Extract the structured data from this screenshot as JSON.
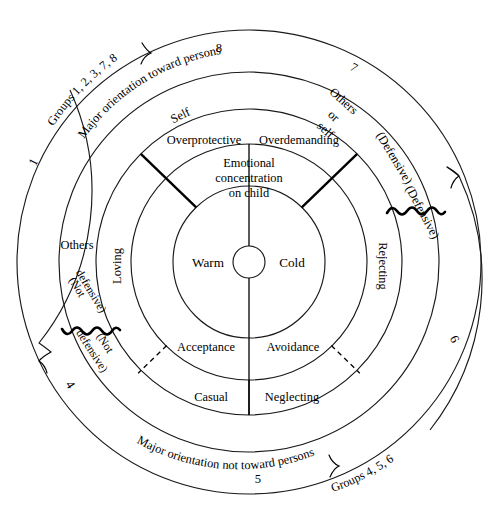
{
  "diagram": {
    "type": "concentric-circumplex",
    "center": {
      "x": 249,
      "y": 262
    },
    "core": {
      "label": "",
      "radius": 16
    },
    "rings": [
      {
        "name": "affect",
        "inner_radius": 16,
        "outer_radius": 76,
        "segments": [
          {
            "id": "warm",
            "label": "Warm",
            "side": "left"
          },
          {
            "id": "cold",
            "label": "Cold",
            "side": "right"
          }
        ]
      },
      {
        "name": "attitude",
        "inner_radius": 76,
        "outer_radius": 118,
        "segments": [
          {
            "id": "emotional-concentration",
            "label": "Emotional\nconcentration\non child",
            "position": "top"
          },
          {
            "id": "acceptance",
            "label": "Acceptance",
            "position": "bottom-left"
          },
          {
            "id": "avoidance",
            "label": "Avoidance",
            "position": "bottom-right"
          }
        ]
      },
      {
        "name": "behavior",
        "inner_radius": 118,
        "outer_radius": 153,
        "segments": [
          {
            "id": "overprotective",
            "label": "Overprotective",
            "position": "top-left"
          },
          {
            "id": "overdemanding",
            "label": "Overdemanding",
            "position": "top-right"
          },
          {
            "id": "loving",
            "label": "Loving",
            "position": "left"
          },
          {
            "id": "rejecting",
            "label": "Rejecting",
            "position": "right"
          },
          {
            "id": "casual",
            "label": "Casual",
            "position": "bottom-left"
          },
          {
            "id": "neglecting",
            "label": "Neglecting",
            "position": "bottom-right"
          }
        ]
      },
      {
        "name": "orientation",
        "inner_radius": 153,
        "outer_radius": 190,
        "segments": [
          {
            "id": "self",
            "label": "Self",
            "position": "top-center-left"
          },
          {
            "id": "others-or-self",
            "label": "Others\nor\nself",
            "position": "top-right"
          },
          {
            "id": "others",
            "label": "Others",
            "position": "left"
          },
          {
            "id": "defensive-upper",
            "label": "(Defensive)",
            "position": "right-upper"
          },
          {
            "id": "not-defensive-upper",
            "label": "(Not\ndefensive)",
            "position": "left-upper"
          }
        ]
      },
      {
        "name": "summary",
        "inner_radius": 190,
        "outer_radius": 232,
        "segments": [
          {
            "id": "major-toward",
            "label": "Major orientation toward persons",
            "position": "upper-arc"
          },
          {
            "id": "major-not-toward",
            "label": "Major orientation not toward persons",
            "position": "lower-arc"
          },
          {
            "id": "defensive-lower",
            "label": "(Defensive)",
            "position": "right"
          },
          {
            "id": "not-defensive-lower",
            "label": "(Not\ndefensive)",
            "position": "left"
          }
        ]
      },
      {
        "name": "groups",
        "inner_radius": 232,
        "outer_radius": 232,
        "segments": [
          {
            "id": "group-1",
            "label": "1",
            "position": "upper-left"
          },
          {
            "id": "group-8",
            "label": "8",
            "position": "top-left-of-center"
          },
          {
            "id": "group-7",
            "label": "7",
            "position": "top-right-of-center"
          },
          {
            "id": "group-6",
            "label": "6",
            "position": "right"
          },
          {
            "id": "group-5",
            "label": "5",
            "position": "bottom"
          },
          {
            "id": "group-4",
            "label": "4",
            "position": "lower-left"
          }
        ]
      }
    ],
    "outer_labels": [
      {
        "id": "groups-upper",
        "label": "Groups 1, 2, 3, 7, 8",
        "position": "upper-left-outside"
      },
      {
        "id": "groups-lower",
        "label": "Groups 4, 5, 6",
        "position": "lower-right-outside"
      }
    ],
    "text": {
      "warm": "Warm",
      "cold": "Cold",
      "emotional_1": "Emotional",
      "emotional_2": "concentration",
      "emotional_3": "on child",
      "acceptance": "Acceptance",
      "avoidance": "Avoidance",
      "overprotective": "Overprotective",
      "overdemanding": "Overdemanding",
      "loving": "Loving",
      "rejecting": "Rejecting",
      "casual": "Casual",
      "neglecting": "Neglecting",
      "self": "Self",
      "others_or_self_1": "Others",
      "others_or_self_2": "or",
      "others_or_self_3": "self",
      "others": "Others",
      "defensive_upper": "(Defensive)",
      "defensive_lower": "(Defensive)",
      "not_defensive_upper_1": "(Not",
      "not_defensive_upper_2": "defensive)",
      "not_defensive_lower_1": "(Not",
      "not_defensive_lower_2": "defensive)",
      "major_toward": "Major orientation toward persons",
      "major_not_toward": "Major orientation not toward persons",
      "num_1": "1",
      "num_4": "4",
      "num_5": "5",
      "num_6": "6",
      "num_7": "7",
      "num_8": "8",
      "groups_upper": "Groups 1, 2, 3, 7, 8",
      "groups_lower": "Groups 4, 5, 6"
    },
    "colors": {
      "stroke": "#1a1a1a",
      "background": "#ffffff",
      "text": "#000000"
    }
  }
}
